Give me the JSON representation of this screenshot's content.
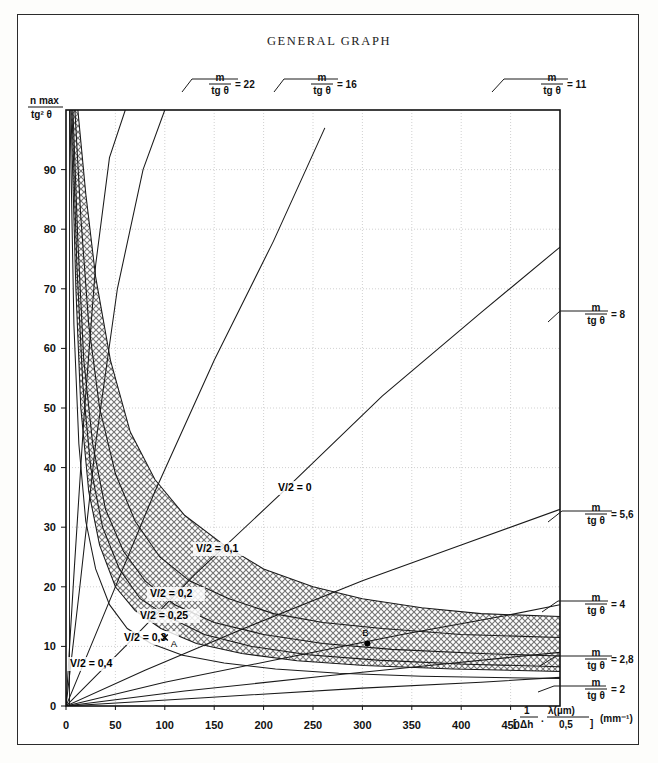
{
  "page": {
    "title": "GENERAL GRAPH"
  },
  "chart_data": {
    "type": "line",
    "title": "GENERAL GRAPH",
    "xlabel": "[ 1/Δh . λ(µm)/0,5 ] (mm⁻¹)",
    "ylabel": "n max / tg² θ",
    "xlim": [
      0,
      500
    ],
    "ylim": [
      0,
      100
    ],
    "xticks": [
      0,
      50,
      100,
      150,
      200,
      250,
      300,
      350,
      400,
      450
    ],
    "yticks": [
      0,
      10,
      20,
      30,
      40,
      50,
      60,
      70,
      80,
      90
    ],
    "grid": true,
    "legend": "inline-annotations",
    "y_axis_label_parts": {
      "numerator": "n max",
      "denominator": "tg² θ"
    },
    "x_axis_label_parts": {
      "bracket_open": "[",
      "frac1_num": "1",
      "frac1_den": "Δh",
      "dot": ".",
      "frac2_num": "λ(µm)",
      "frac2_den": "0,5",
      "bracket_close": "]",
      "unit": "(mm⁻¹)"
    },
    "m_over_tgtheta_label_prefix_num": "m",
    "m_over_tgtheta_label_prefix_den": "tg θ",
    "m_curves": [
      {
        "value": "22",
        "label": "m/tg θ = 22",
        "label_x": 220,
        "label_y": 84,
        "leader": [
          [
            182,
            92
          ],
          [
            192,
            79
          ],
          [
            238,
            79
          ]
        ],
        "points": [
          [
            0,
            0
          ],
          [
            8,
            22
          ],
          [
            18,
            48
          ],
          [
            30,
            74
          ],
          [
            44,
            92
          ],
          [
            60,
            100
          ]
        ]
      },
      {
        "value": "16",
        "label": "m/tg θ = 16",
        "label_x": 322,
        "label_y": 84,
        "leader": [
          [
            274,
            92
          ],
          [
            284,
            79
          ],
          [
            338,
            79
          ]
        ],
        "points": [
          [
            0,
            0
          ],
          [
            14,
            20
          ],
          [
            30,
            44
          ],
          [
            52,
            70
          ],
          [
            78,
            90
          ],
          [
            100,
            100
          ]
        ]
      },
      {
        "value": "11",
        "label": "m/tg θ = 11",
        "label_x": 552,
        "label_y": 84,
        "leader": [
          [
            492,
            92
          ],
          [
            504,
            79
          ],
          [
            568,
            79
          ]
        ],
        "points": [
          [
            0,
            0
          ],
          [
            40,
            16
          ],
          [
            90,
            36
          ],
          [
            150,
            58
          ],
          [
            210,
            78
          ],
          [
            262,
            97
          ]
        ]
      },
      {
        "value": "8",
        "label": "m/tg θ = 8",
        "label_x": 596,
        "label_y": 314,
        "leader": [
          [
            548,
            322
          ],
          [
            560,
            311
          ],
          [
            608,
            311
          ]
        ],
        "points": [
          [
            0,
            0
          ],
          [
            60,
            10
          ],
          [
            130,
            22
          ],
          [
            220,
            36
          ],
          [
            320,
            52
          ],
          [
            420,
            66
          ],
          [
            500,
            77
          ]
        ]
      },
      {
        "value": "5,6",
        "label": "m/tg θ = 5,6",
        "label_x": 596,
        "label_y": 514,
        "leader": [
          [
            548,
            522
          ],
          [
            562,
            511
          ],
          [
            612,
            511
          ]
        ],
        "points": [
          [
            0,
            0
          ],
          [
            80,
            6
          ],
          [
            180,
            13
          ],
          [
            300,
            21
          ],
          [
            400,
            27
          ],
          [
            500,
            33
          ]
        ]
      },
      {
        "value": "4",
        "label": "m/tg θ = 4",
        "label_x": 596,
        "label_y": 604,
        "leader": [
          [
            542,
            612
          ],
          [
            558,
            601
          ],
          [
            608,
            601
          ]
        ],
        "points": [
          [
            0,
            0
          ],
          [
            100,
            4
          ],
          [
            220,
            8
          ],
          [
            340,
            12
          ],
          [
            440,
            15
          ],
          [
            500,
            17
          ]
        ]
      },
      {
        "value": "2,8",
        "label": "m/tg θ = 2,8",
        "label_x": 596,
        "label_y": 659,
        "leader": [
          [
            540,
            666
          ],
          [
            556,
            656
          ],
          [
            612,
            656
          ]
        ],
        "points": [
          [
            0,
            0
          ],
          [
            120,
            2.5
          ],
          [
            260,
            5
          ],
          [
            380,
            7
          ],
          [
            500,
            9
          ]
        ]
      },
      {
        "value": "2",
        "label": "m/tg θ = 2",
        "label_x": 596,
        "label_y": 689,
        "leader": [
          [
            538,
            692
          ],
          [
            554,
            686
          ],
          [
            606,
            686
          ]
        ],
        "points": [
          [
            0,
            0
          ],
          [
            140,
            1.4
          ],
          [
            300,
            3
          ],
          [
            420,
            4
          ],
          [
            500,
            4.8
          ]
        ]
      }
    ],
    "v_curves": [
      {
        "value": "0",
        "label": "V/2 = 0",
        "label_x": 278,
        "label_y": 491,
        "points": [
          [
            12,
            100
          ],
          [
            20,
            86
          ],
          [
            30,
            72
          ],
          [
            45,
            58
          ],
          [
            65,
            46
          ],
          [
            90,
            38
          ],
          [
            120,
            32
          ],
          [
            160,
            27
          ],
          [
            200,
            23
          ],
          [
            250,
            20
          ],
          [
            300,
            18
          ],
          [
            360,
            16.5
          ],
          [
            420,
            15.5
          ],
          [
            500,
            15
          ]
        ]
      },
      {
        "value": "0,1",
        "label": "V/2 = 0,1",
        "label_x": 196,
        "label_y": 552,
        "points": [
          [
            9,
            100
          ],
          [
            15,
            82
          ],
          [
            23,
            64
          ],
          [
            34,
            50
          ],
          [
            50,
            39
          ],
          [
            70,
            31
          ],
          [
            95,
            25
          ],
          [
            125,
            21
          ],
          [
            165,
            18
          ],
          [
            210,
            15.5
          ],
          [
            260,
            14
          ],
          [
            320,
            13
          ],
          [
            400,
            12
          ],
          [
            500,
            11.5
          ]
        ]
      },
      {
        "value": "0,2",
        "label": "V/2 = 0,2",
        "label_x": 150,
        "label_y": 597,
        "points": [
          [
            7,
            100
          ],
          [
            12,
            78
          ],
          [
            18,
            58
          ],
          [
            27,
            44
          ],
          [
            40,
            33
          ],
          [
            58,
            26
          ],
          [
            80,
            21
          ],
          [
            110,
            17
          ],
          [
            150,
            14
          ],
          [
            200,
            12
          ],
          [
            260,
            10.5
          ],
          [
            330,
            9.5
          ],
          [
            420,
            8.8
          ],
          [
            500,
            8.4
          ]
        ]
      },
      {
        "value": "0,25",
        "label": "V/2 = 0,25",
        "label_x": 140,
        "label_y": 619,
        "points": [
          [
            6,
            100
          ],
          [
            11,
            74
          ],
          [
            17,
            54
          ],
          [
            25,
            40
          ],
          [
            37,
            30
          ],
          [
            54,
            23
          ],
          [
            75,
            18
          ],
          [
            103,
            15
          ],
          [
            140,
            12
          ],
          [
            188,
            10
          ],
          [
            245,
            8.6
          ],
          [
            315,
            7.7
          ],
          [
            405,
            7
          ],
          [
            500,
            6.6
          ]
        ]
      },
      {
        "value": "0,3",
        "label": "V/2 = 0,3",
        "label_x": 124,
        "label_y": 641,
        "points": [
          [
            5,
            100
          ],
          [
            10,
            70
          ],
          [
            15,
            50
          ],
          [
            23,
            36
          ],
          [
            34,
            27
          ],
          [
            50,
            20
          ],
          [
            70,
            16
          ],
          [
            96,
            13
          ],
          [
            132,
            10.5
          ],
          [
            178,
            8.8
          ],
          [
            234,
            7.6
          ],
          [
            302,
            6.8
          ],
          [
            392,
            6.2
          ],
          [
            500,
            5.8
          ]
        ]
      },
      {
        "value": "0,4",
        "label": "V/2 = 0,4",
        "label_x": 70,
        "label_y": 667,
        "points": [
          [
            4,
            100
          ],
          [
            8,
            64
          ],
          [
            13,
            44
          ],
          [
            20,
            31
          ],
          [
            30,
            23
          ],
          [
            44,
            17
          ],
          [
            62,
            13
          ],
          [
            86,
            10.5
          ],
          [
            118,
            8.5
          ],
          [
            160,
            7.2
          ],
          [
            212,
            6.2
          ],
          [
            276,
            5.5
          ],
          [
            360,
            5
          ],
          [
            500,
            4.6
          ]
        ]
      }
    ],
    "points_of_interest": [
      {
        "label": "A",
        "x": 100,
        "y": 11.5,
        "marker": "cross"
      },
      {
        "label": "B",
        "x": 305,
        "y": 10.5,
        "marker": "dot"
      }
    ],
    "shaded_region_note": "cross-hatched operating envelope"
  }
}
